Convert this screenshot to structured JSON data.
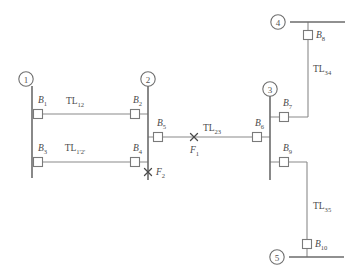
{
  "diagram": {
    "type": "single-line-schematic",
    "colors": {
      "bus": "#6b6b6b",
      "branch": "#8a8a8a",
      "breaker_stroke": "#7a7a7a",
      "breaker_fill": "#ffffff",
      "label": "#4a4a4a",
      "background": "#ffffff"
    }
  },
  "nodes": [
    {
      "id": "1",
      "label": "1",
      "orientation": "vertical-bus",
      "cx": 26,
      "cy": 79,
      "bus": {
        "x1": 32,
        "y1": 86,
        "x2": 32,
        "y2": 178
      }
    },
    {
      "id": "2",
      "label": "2",
      "orientation": "vertical-bus",
      "cx": 148,
      "cy": 79,
      "bus": {
        "x1": 148,
        "y1": 86,
        "x2": 148,
        "y2": 180
      }
    },
    {
      "id": "3",
      "label": "3",
      "orientation": "vertical-bus",
      "cx": 270,
      "cy": 89,
      "bus": {
        "x1": 270,
        "y1": 96,
        "x2": 270,
        "y2": 180
      }
    },
    {
      "id": "4",
      "label": "4",
      "orientation": "horizontal-bus",
      "cx": 278,
      "cy": 22,
      "bus": {
        "x1": 290,
        "y1": 22,
        "x2": 345,
        "y2": 22
      }
    },
    {
      "id": "5",
      "label": "5",
      "orientation": "horizontal-bus",
      "cx": 277,
      "cy": 257,
      "bus": {
        "x1": 289,
        "y1": 257,
        "x2": 344,
        "y2": 257
      }
    }
  ],
  "breakers": [
    {
      "id": "B1",
      "base": "B",
      "sub": "1",
      "x": 38,
      "y": 114,
      "label_x": 38,
      "label_y": 101,
      "label_anchor": "start"
    },
    {
      "id": "B2",
      "base": "B",
      "sub": "2",
      "x": 135,
      "y": 114,
      "label_x": 133,
      "label_y": 101,
      "label_anchor": "start"
    },
    {
      "id": "B3",
      "base": "B",
      "sub": "3",
      "x": 38,
      "y": 162,
      "label_x": 38,
      "label_y": 149,
      "label_anchor": "start"
    },
    {
      "id": "B4",
      "base": "B",
      "sub": "4",
      "x": 135,
      "y": 162,
      "label_x": 133,
      "label_y": 149,
      "label_anchor": "start"
    },
    {
      "id": "B5",
      "base": "B",
      "sub": "5",
      "x": 158,
      "y": 137,
      "label_x": 157,
      "label_y": 124,
      "label_anchor": "start"
    },
    {
      "id": "B6",
      "base": "B",
      "sub": "6",
      "x": 257,
      "y": 137,
      "label_x": 255,
      "label_y": 124,
      "label_anchor": "start"
    },
    {
      "id": "B7",
      "base": "B",
      "sub": "7",
      "x": 284,
      "y": 117,
      "label_x": 283,
      "label_y": 104,
      "label_anchor": "start"
    },
    {
      "id": "B8",
      "base": "B",
      "sub": "8",
      "x": 308,
      "y": 35,
      "label_x": 316,
      "label_y": 36,
      "label_anchor": "start"
    },
    {
      "id": "B9",
      "base": "B",
      "sub": "9",
      "x": 284,
      "y": 162,
      "label_x": 283,
      "label_y": 149,
      "label_anchor": "start"
    },
    {
      "id": "B10",
      "base": "B",
      "sub": "10",
      "x": 307,
      "y": 244,
      "label_x": 315,
      "label_y": 245,
      "label_anchor": "start"
    }
  ],
  "lines": [
    {
      "id": "TL12",
      "base": "TL",
      "sub": "12",
      "label_x": 75,
      "label_y": 102,
      "from": "1",
      "to": "2"
    },
    {
      "id": "TL1p2p",
      "base": "TL",
      "sub": "1'2'",
      "label_x": 75,
      "label_y": 149,
      "from": "1",
      "to": "2"
    },
    {
      "id": "TL23",
      "base": "TL",
      "sub": "23",
      "label_x": 212,
      "label_y": 129,
      "from": "2",
      "to": "3"
    },
    {
      "id": "TL34",
      "base": "TL",
      "sub": "34",
      "label_x": 313,
      "label_y": 70,
      "from": "3",
      "to": "4"
    },
    {
      "id": "TL35",
      "base": "TL",
      "sub": "35",
      "label_x": 313,
      "label_y": 207,
      "from": "3",
      "to": "5"
    }
  ],
  "faults": [
    {
      "id": "F1",
      "base": "F",
      "sub": "1",
      "x": 194,
      "y": 137,
      "label_x": 190,
      "label_y": 151,
      "on": "TL23"
    },
    {
      "id": "F2",
      "base": "F",
      "sub": "2",
      "x": 148,
      "y": 172,
      "label_x": 156,
      "label_y": 173,
      "on": "bus-2"
    }
  ],
  "conductors": {
    "tl12_top": {
      "x1": 38,
      "y1": 114,
      "x2": 148,
      "y2": 114
    },
    "tl12_bottom": {
      "x1": 38,
      "y1": 162,
      "x2": 148,
      "y2": 162
    },
    "tl23": {
      "x1": 148,
      "y1": 137,
      "x2": 270,
      "y2": 137
    },
    "tl34_h_bot": {
      "x1": 270,
      "y1": 117,
      "x2": 308,
      "y2": 117
    },
    "tl34_v": {
      "x1": 308,
      "y1": 117,
      "x2": 308,
      "y2": 22
    },
    "tl35_h_top": {
      "x1": 270,
      "y1": 162,
      "x2": 307,
      "y2": 162
    },
    "tl35_v": {
      "x1": 307,
      "y1": 162,
      "x2": 307,
      "y2": 257
    }
  }
}
